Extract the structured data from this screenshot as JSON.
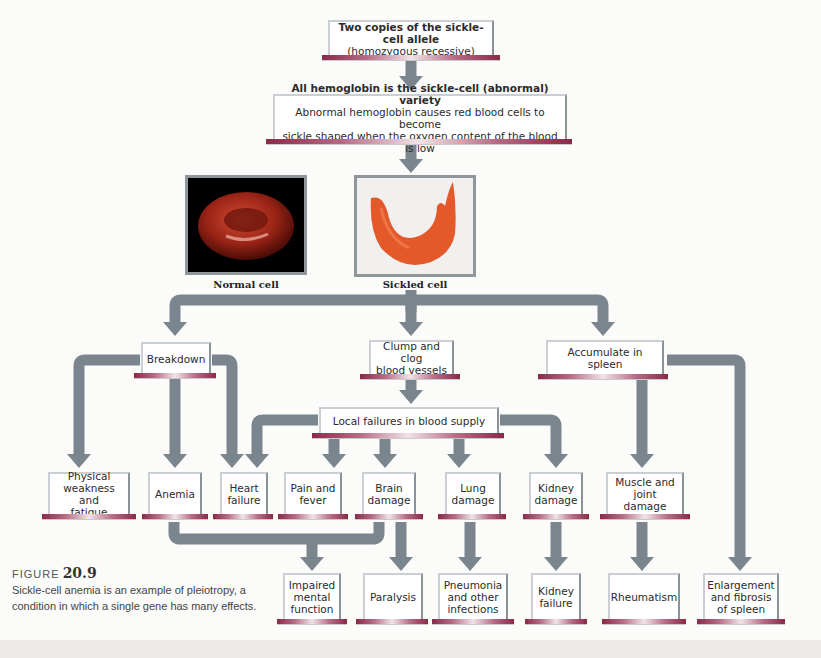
{
  "diagram": {
    "colors": {
      "arrow": "#7b858d",
      "box_border": "#c9cfd4",
      "base_bar": "#8a2a48"
    },
    "top": {
      "line1": "Two copies of the sickle-cell allele",
      "line2": "(homozygous recessive)"
    },
    "hemoglobin": {
      "line1": "All hemoglobin is the sickle-cell (abnormal) variety",
      "line2": "Abnormal hemoglobin causes red blood cells to become",
      "line3": "sickle shaped when the oxygen content of the blood is low"
    },
    "images": {
      "normal_caption": "Normal cell",
      "sickled_caption": "Sickled cell"
    },
    "level1": {
      "breakdown": "Breakdown",
      "clump": "Clump and clog\nblood vessels",
      "spleen": "Accumulate in spleen"
    },
    "local_failures": "Local failures in blood supply",
    "level2": {
      "weakness": "Physical\nweakness and\nfatigue",
      "anemia": "Anemia",
      "heart": "Heart\nfailure",
      "pain": "Pain and\nfever",
      "brain": "Brain\ndamage",
      "lung": "Lung\ndamage",
      "kidney": "Kidney\ndamage",
      "muscle": "Muscle and\njoint damage"
    },
    "level3": {
      "impaired": "Impaired\nmental\nfunction",
      "paralysis": "Paralysis",
      "pneumonia": "Pneumonia\nand other\ninfections",
      "kidney_failure": "Kidney\nfailure",
      "rheumatism": "Rheumatism",
      "enlargement": "Enlargement\nand fibrosis\nof spleen"
    }
  },
  "caption": {
    "figure_label": "FIGURE",
    "figure_number": "20.9",
    "text": "Sickle-cell anemia is an example of pleiotropy, a condition in which a single gene has many effects."
  }
}
